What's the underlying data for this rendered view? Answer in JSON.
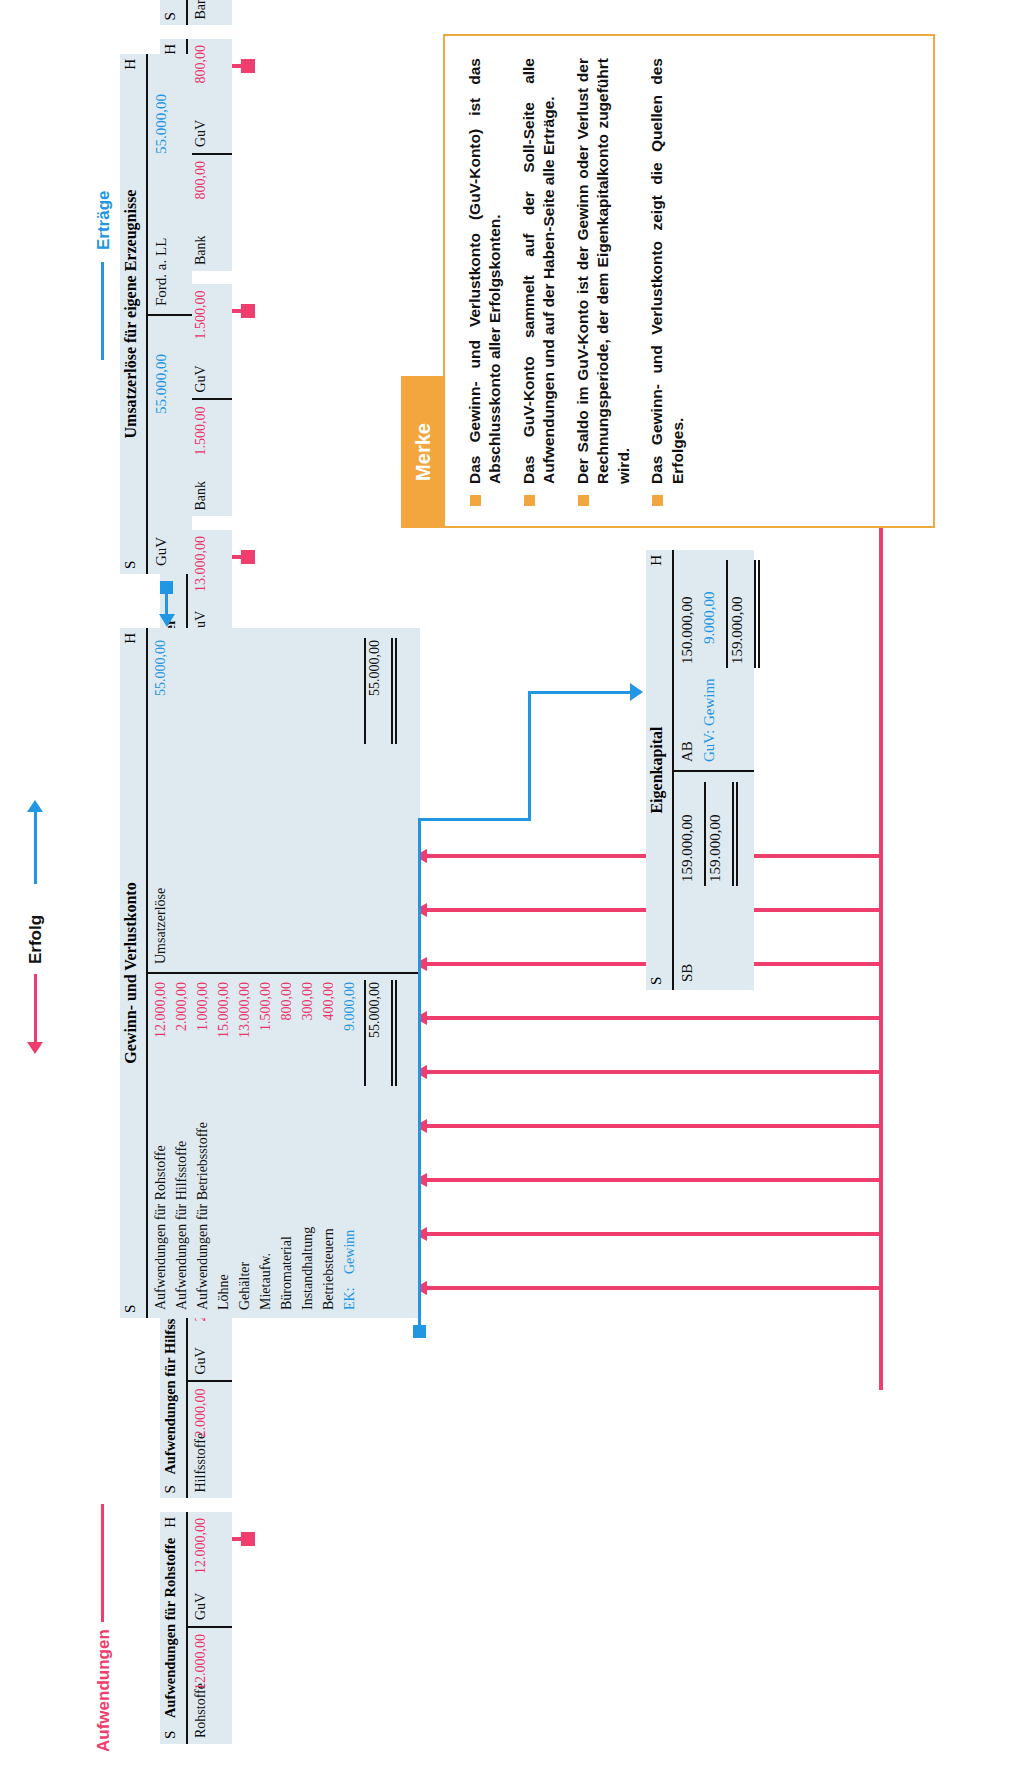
{
  "flow_labels": {
    "aufwendungen": "Aufwendungen",
    "erfolg": "Erfolg",
    "ertraege": "Erträge"
  },
  "colors": {
    "expense_accent": "#ef3e6d",
    "revenue_accent": "#2196e3",
    "note_accent": "#f3a63e",
    "account_bg": "#dfeaf0"
  },
  "side_labels": {
    "soll": "S",
    "haben": "H"
  },
  "expense_accounts": [
    {
      "title": "Aufwendungen für Rohstoffe",
      "debit_text": "Rohstoffe",
      "debit_amount": "12.000,00",
      "credit_text": "GuV",
      "credit_amount": "12.000,00"
    },
    {
      "title": "Aufwendungen für Hilfsstoffe",
      "debit_text": "Hilfsstoffe",
      "debit_amount": "2.000,00",
      "credit_text": "GuV",
      "credit_amount": "2.000,00"
    },
    {
      "title": "Aufwendungen für Betriebsstoffe",
      "debit_text": "Betriebsstoffe",
      "debit_amount": "1.000,00",
      "credit_text": "GuV",
      "credit_amount": "1.000,00"
    },
    {
      "title": "Löhne",
      "debit_text": "Bank",
      "debit_amount": "15.000,00",
      "credit_text": "GuV",
      "credit_amount": "15.000,00"
    },
    {
      "title": "Gehälter",
      "debit_text": "Bank",
      "debit_amount": "13.000,00",
      "credit_text": "GuV",
      "credit_amount": "13.000,00"
    },
    {
      "title": "Mietaufwendungen",
      "debit_text": "Bank",
      "debit_amount": "1.500,00",
      "credit_text": "GuV",
      "credit_amount": "1.500,00"
    },
    {
      "title": "Büromaterial",
      "debit_text": "Bank",
      "debit_amount": "800,00",
      "credit_text": "GuV",
      "credit_amount": "800,00"
    },
    {
      "title": "Fremdinstandhaltung",
      "debit_text": "Bank",
      "debit_amount": "300,00",
      "credit_text": "GuV",
      "credit_amount": "300,00"
    },
    {
      "title": "Betriebsteuern",
      "debit_text": "Bank",
      "debit_amount": "400,00",
      "credit_text": "GuV",
      "credit_amount": "400,00"
    }
  ],
  "guv_account": {
    "title": "Gewinn- und Verlustkonto",
    "debit_rows": [
      {
        "text": "Aufwendungen für Rohstoffe",
        "amount": "12.000,00"
      },
      {
        "text": "Aufwendungen für Hilfsstoffe",
        "amount": "2.000,00"
      },
      {
        "text": "Aufwendungen für Betriebsstoffe",
        "amount": "1.000,00"
      },
      {
        "text": "Löhne",
        "amount": "15.000,00"
      },
      {
        "text": "Gehälter",
        "amount": "13.000,00"
      },
      {
        "text": "Mietaufw.",
        "amount": "1.500,00"
      },
      {
        "text": "Büromaterial",
        "amount": "800,00"
      },
      {
        "text": "Instandhaltung",
        "amount": "300,00"
      },
      {
        "text": "Betriebsteuern",
        "amount": "400,00"
      }
    ],
    "debit_balance_label": "EK:",
    "debit_balance_text": "Gewinn",
    "debit_balance_amount": "9.000,00",
    "debit_total": "55.000,00",
    "credit_rows": [
      {
        "text": "Umsatzerlöse",
        "amount": "55.000,00"
      }
    ],
    "credit_total": "55.000,00"
  },
  "revenue_account": {
    "title": "Umsatzerlöse für eigene Erzeugnisse",
    "debit_text": "GuV",
    "debit_amount": "55.000,00",
    "credit_text": "Ford. a. LL",
    "credit_amount": "55.000,00"
  },
  "equity_account": {
    "title": "Eigenkapital",
    "debit_text": "SB",
    "debit_amount": "159.000,00",
    "debit_total": "159.000,00",
    "credit_rows": [
      {
        "text": "AB",
        "amount": "150.000,00"
      },
      {
        "text": "GuV: Gewinn",
        "amount": "9.000,00"
      }
    ],
    "credit_total": "159.000,00"
  },
  "merke": {
    "tab_label": "Merke",
    "bullets": [
      "Das Gewinn- und Verlustkonto (GuV-Konto) ist das Abschlusskonto aller Erfolgskonten.",
      "Das GuV-Konto sammelt auf der Soll-Seite alle Aufwendungen und auf der Haben-Seite alle Erträge.",
      "Der Saldo im GuV-Konto ist der Gewinn oder Verlust der Rechnungsperiode, der dem Eigenkapitalkonto zugeführt wird.",
      "Das Gewinn- und Verlustkonto zeigt die Quellen des Erfolges."
    ]
  }
}
